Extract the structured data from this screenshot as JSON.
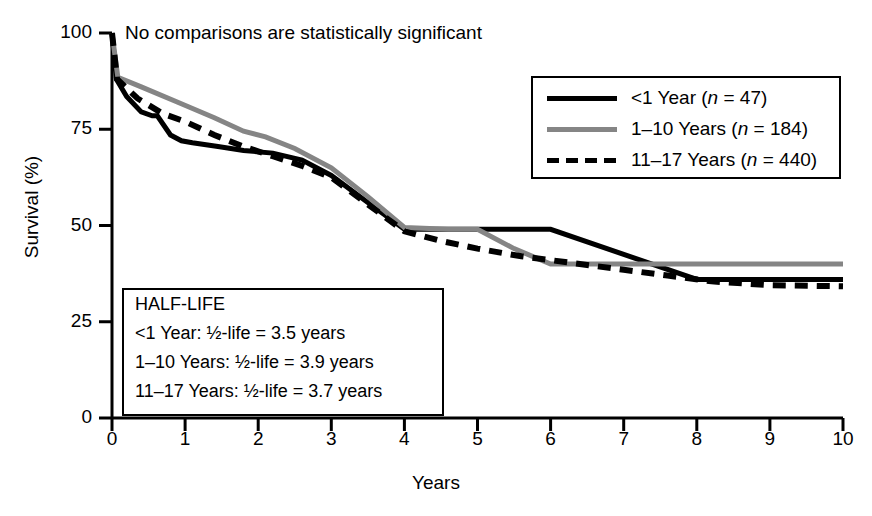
{
  "figure": {
    "note": "No comparisons are statistically significant",
    "xlabel": "Years",
    "ylabel": "Survival (%)"
  },
  "axes": {
    "xticks": [
      "0",
      "1",
      "2",
      "3",
      "4",
      "5",
      "6",
      "7",
      "8",
      "9",
      "10"
    ],
    "yticks": [
      "100",
      "75",
      "50",
      "25",
      "0"
    ]
  },
  "legend": {
    "items": [
      {
        "label_main": "<1 Year (",
        "n_italic": "n",
        "n_rest": " = 47)",
        "style": "solid-black"
      },
      {
        "label_main": "1–10 Years (",
        "n_italic": "n",
        "n_rest": " = 184)",
        "style": "solid-gray"
      },
      {
        "label_main": "11–17 Years (",
        "n_italic": "n",
        "n_rest": " = 440)",
        "style": "dashed-black"
      }
    ]
  },
  "halflife": {
    "title": "HALF-LIFE",
    "rows": [
      {
        "group": "<1 Year: ",
        "frac": "½",
        "rest": "-life = 3.5 years"
      },
      {
        "group": "1–10 Years: ",
        "frac": "½",
        "rest": "-life = 3.9 years"
      },
      {
        "group": "11–17 Years: ",
        "frac": "½",
        "rest": "-life = 3.7 years"
      }
    ]
  },
  "colors": {
    "black": "#000000",
    "gray": "#858585"
  },
  "chart_data": {
    "type": "line",
    "title": "",
    "subtitle": "No comparisons are statistically significant",
    "xlabel": "Years",
    "ylabel": "Survival (%)",
    "xlim": [
      0,
      10
    ],
    "ylim": [
      0,
      100
    ],
    "xticks": [
      0,
      1,
      2,
      3,
      4,
      5,
      6,
      7,
      8,
      9,
      10
    ],
    "yticks": [
      0,
      25,
      50,
      75,
      100
    ],
    "grid": false,
    "legend_position": "top-right",
    "annotations": [
      "HALF-LIFE",
      "<1 Year: ½-life = 3.5 years",
      "1–10 Years: ½-life = 3.9 years",
      "11–17 Years: ½-life = 3.7 years"
    ],
    "series": [
      {
        "name": "<1 Year (n = 47)",
        "n": 47,
        "half_life_years": 3.5,
        "color": "#000000",
        "linestyle": "solid",
        "x": [
          0.0,
          0.06,
          0.2,
          0.4,
          0.55,
          0.62,
          0.8,
          0.95,
          1.1,
          1.45,
          1.8,
          2.2,
          2.6,
          3.0,
          3.5,
          4.0,
          4.4,
          6.0,
          8.0,
          10.0
        ],
        "y": [
          100.0,
          88.0,
          83.5,
          79.5,
          78.5,
          78.5,
          73.5,
          72.0,
          71.5,
          70.5,
          69.5,
          68.8,
          67.0,
          63.0,
          56.0,
          49.0,
          49.0,
          49.0,
          36.0,
          36.0
        ]
      },
      {
        "name": "1–10 Years (n = 184)",
        "n": 184,
        "half_life_years": 3.9,
        "color": "#858585",
        "linestyle": "solid",
        "x": [
          0.0,
          0.08,
          0.4,
          0.9,
          1.4,
          1.8,
          2.1,
          2.5,
          3.0,
          3.5,
          4.0,
          4.6,
          5.0,
          5.5,
          6.0,
          8.0,
          10.0
        ],
        "y": [
          100.0,
          88.5,
          86.0,
          82.0,
          78.0,
          74.5,
          73.0,
          70.0,
          65.0,
          57.5,
          49.5,
          49.0,
          49.0,
          44.0,
          40.0,
          40.0,
          40.0
        ]
      },
      {
        "name": "11–17 Years (n = 440)",
        "n": 440,
        "half_life_years": 3.7,
        "color": "#000000",
        "linestyle": "dashed",
        "x": [
          0.0,
          0.07,
          0.35,
          0.7,
          1.0,
          1.4,
          1.8,
          2.2,
          2.6,
          3.0,
          3.5,
          4.0,
          4.5,
          5.0,
          5.6,
          6.2,
          7.0,
          7.6,
          8.2,
          9.0,
          10.0
        ],
        "y": [
          100.0,
          88.0,
          83.0,
          79.0,
          77.0,
          73.5,
          70.5,
          68.0,
          65.5,
          62.5,
          55.5,
          48.5,
          46.0,
          44.0,
          42.0,
          40.5,
          38.5,
          37.0,
          35.5,
          34.5,
          34.2
        ]
      }
    ]
  }
}
